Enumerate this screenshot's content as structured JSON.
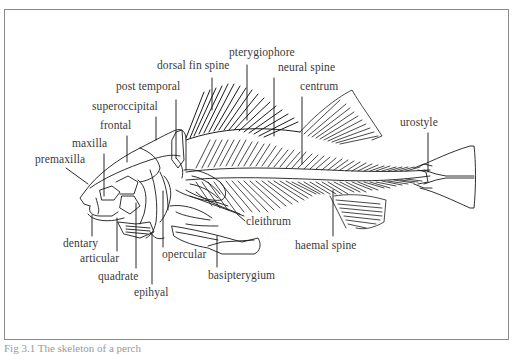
{
  "figure": {
    "caption": "Fig 3.1 The skeleton of a perch",
    "frame_color": "#8a8a8a",
    "line_color": "#1a1a1a",
    "label_color": "#3a3a3a"
  },
  "labels": {
    "pterygiophore": "pterygiophore",
    "dorsal_fin_spine": "dorsal fin spine",
    "post_temporal": "post temporal",
    "superoccipital": "superoccipital",
    "frontal": "frontal",
    "maxilla": "maxilla",
    "premaxilla": "premaxilla",
    "neural_spine": "neural spine",
    "centrum": "centrum",
    "urostyle": "urostyle",
    "dentary": "dentary",
    "articular": "articular",
    "quadrate": "quadrate",
    "epihyal": "epihyal",
    "opercular": "opercular",
    "cleithrum": "cleithrum",
    "basipterygium": "basipterygium",
    "haemal_spine": "haemal spine"
  }
}
